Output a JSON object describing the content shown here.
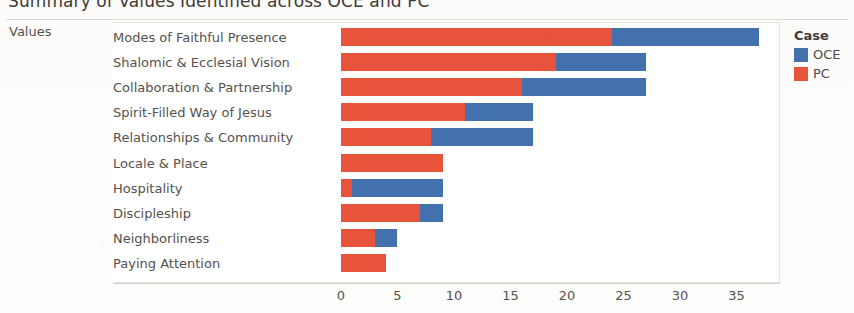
{
  "chart_data": {
    "type": "bar",
    "orientation": "horizontal",
    "stacked": true,
    "title": "Summary of Values Identified across OCE and PC",
    "xlabel": "",
    "ylabel": "Values",
    "field_label": "Values",
    "xlim": [
      0,
      38.5
    ],
    "xticks": [
      0,
      5,
      10,
      15,
      20,
      25,
      30,
      35
    ],
    "xticklabels": [
      "0",
      "5",
      "10",
      "15",
      "20",
      "25",
      "30",
      "35"
    ],
    "grid": false,
    "legend": {
      "title": "Case",
      "position": "right",
      "entries": [
        {
          "name": "OCE",
          "color": "#4271ad"
        },
        {
          "name": "PC",
          "color": "#e8533c"
        }
      ]
    },
    "categories": [
      "Modes of Faithful Presence",
      "Shalomic & Ecclesial Vision",
      "Collaboration & Partnership",
      "Spirit-Filled Way of Jesus",
      "Relationships & Community",
      "Locale & Place",
      "Hospitality",
      "Discipleship",
      "Neighborliness",
      "Paying Attention"
    ],
    "series": [
      {
        "name": "PC",
        "color": "#e8533c",
        "values": [
          24,
          19,
          16,
          11,
          8,
          9,
          1,
          7,
          3,
          4
        ]
      },
      {
        "name": "OCE",
        "color": "#4271ad",
        "values": [
          13,
          8,
          11,
          6,
          9,
          0,
          8,
          2,
          2,
          0
        ]
      }
    ],
    "totals": [
      37,
      27,
      27,
      17,
      17,
      9,
      9,
      9,
      5,
      4
    ]
  }
}
